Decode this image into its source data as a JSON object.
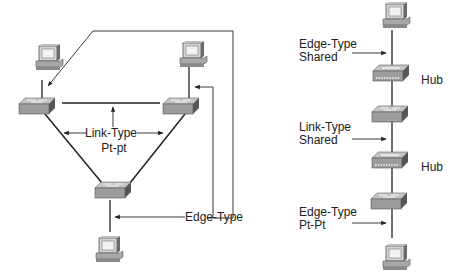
{
  "left_diagram": {
    "labels": {
      "link_type_line1": "Link-Type",
      "link_type_line2": "Pt-pt",
      "edge_type": "Edge-Type"
    },
    "devices": [
      {
        "type": "pc",
        "name": "pc-top-left"
      },
      {
        "type": "switch",
        "name": "switch-top-left"
      },
      {
        "type": "pc",
        "name": "pc-top-right"
      },
      {
        "type": "switch",
        "name": "switch-top-right"
      },
      {
        "type": "switch",
        "name": "switch-bottom"
      },
      {
        "type": "pc",
        "name": "pc-bottom"
      }
    ]
  },
  "right_diagram": {
    "labels": {
      "edge_shared_line1": "Edge-Type",
      "edge_shared_line2": "Shared",
      "link_shared_line1": "Link-Type",
      "link_shared_line2": "Shared",
      "edge_ptpt_line1": "Edge-Type",
      "edge_ptpt_line2": "Pt-Pt",
      "hub1": "Hub",
      "hub2": "Hub"
    },
    "devices": [
      {
        "type": "pc",
        "name": "pc-top"
      },
      {
        "type": "hub",
        "name": "hub-upper"
      },
      {
        "type": "switch",
        "name": "switch-middle"
      },
      {
        "type": "hub",
        "name": "hub-lower"
      },
      {
        "type": "switch",
        "name": "switch-lower"
      },
      {
        "type": "pc",
        "name": "pc-bottom"
      }
    ]
  },
  "colors": {
    "line": "#222222",
    "device_top": "#c8c8c8",
    "device_front": "#9a9a9a",
    "device_side": "#5a5a5a",
    "screen": "#e6e6e6"
  }
}
